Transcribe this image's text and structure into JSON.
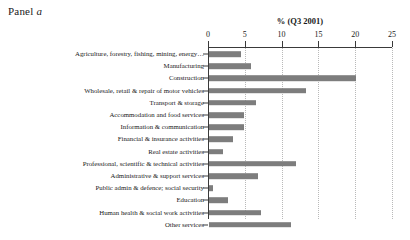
{
  "panel": {
    "prefix": "Panel ",
    "letter": "a"
  },
  "chart_data": {
    "type": "bar",
    "orientation": "horizontal",
    "title": "",
    "xlabel": "% (Q3 2001)",
    "ylabel": "",
    "xlim": [
      0,
      25
    ],
    "xticks": [
      0,
      5,
      10,
      15,
      20,
      25
    ],
    "xticklabels": [
      "0",
      "5",
      "10",
      "15",
      "20",
      "25"
    ],
    "grid": true,
    "grid_axis": "x",
    "grid_style": "dotted",
    "legend": false,
    "bar_color": "#7d7d7d",
    "axis_color": "#3a3a3a",
    "categories": [
      "Agriculture, forestry, fishing, mining, energy…",
      "Manufacturing",
      "Construction",
      "Wholesale, retail & repair of motor vehicles",
      "Transport & storage",
      "Accommodation and food services",
      "Information & communication",
      "Financial & insurance activities",
      "Real estate activities",
      "Professional, scientific & technical activities",
      "Administrative & support services",
      "Public admin & defence; social security",
      "Education",
      "Human health & social work activities",
      "Other services"
    ],
    "values": [
      4.3,
      5.7,
      20.0,
      13.2,
      6.4,
      4.8,
      4.7,
      3.3,
      1.9,
      11.8,
      6.7,
      0.5,
      2.6,
      7.0,
      11.2
    ]
  }
}
